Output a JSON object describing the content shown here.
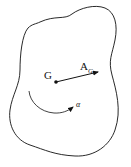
{
  "diagram": {
    "labels": {
      "center": "G",
      "accel_main": "A",
      "accel_sub": "G",
      "angular": "α"
    },
    "colors": {
      "stroke": "#111111",
      "background": "#ffffff"
    }
  }
}
